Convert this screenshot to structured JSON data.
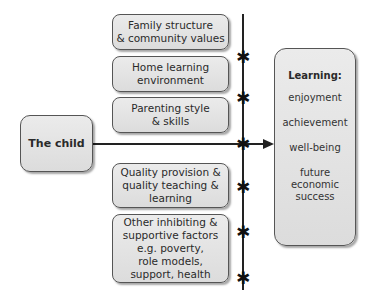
{
  "diagram": {
    "child": {
      "label": "The child"
    },
    "factors": [
      {
        "id": "family",
        "lines": [
          "Family structure",
          "& community values"
        ]
      },
      {
        "id": "home",
        "lines": [
          "Home learning",
          "environment"
        ]
      },
      {
        "id": "parenting",
        "lines": [
          "Parenting style",
          "& skills"
        ]
      },
      {
        "id": "quality",
        "lines": [
          "Quality provision &",
          "quality teaching &",
          "learning"
        ]
      },
      {
        "id": "other",
        "lines": [
          "Other inhibiting &",
          "supportive factors",
          "e.g. poverty,",
          "role models,",
          "support, health"
        ]
      }
    ],
    "learning": {
      "title": "Learning:",
      "outcomes": [
        {
          "lines": [
            "enjoyment"
          ]
        },
        {
          "lines": [
            "achievement"
          ]
        },
        {
          "lines": [
            "well-being"
          ]
        },
        {
          "lines": [
            "future",
            "economic",
            "success"
          ]
        }
      ]
    },
    "star_marker": "✱"
  }
}
